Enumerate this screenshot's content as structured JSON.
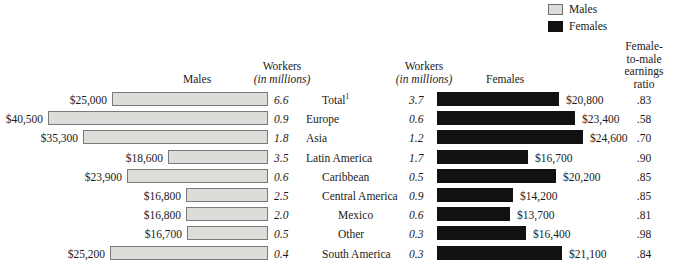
{
  "legend": {
    "items": [
      {
        "label": "Males",
        "swatch": "males-swatch",
        "color": "#dcdcd8"
      },
      {
        "label": "Females",
        "swatch": "females-swatch",
        "color": "#111111"
      }
    ]
  },
  "headers": {
    "males": "Males",
    "females": "Females",
    "workers_line1": "Workers",
    "workers_line2": "(in millions)",
    "ratio": "Female-\nto-male\nearnings\nratio",
    "ratio_lines": [
      "Female-",
      "to-male",
      "earnings",
      "ratio"
    ]
  },
  "chart_data": {
    "type": "bar",
    "title": "",
    "orientation": "horizontal",
    "layout": "bidirectional-population-pyramid",
    "xlabel": "",
    "ylabel": "",
    "grid": false,
    "legend_position": "top-right",
    "categories": [
      "Total¹",
      "Europe",
      "Asia",
      "Latin America",
      "Caribbean",
      "Central America",
      "Mexico",
      "Other",
      "South America"
    ],
    "category_indent_levels": [
      1,
      0,
      0,
      0,
      1,
      1,
      2,
      2,
      1
    ],
    "series": [
      {
        "name": "Males",
        "unit": "median annual earnings (USD)",
        "direction": "left",
        "color": "#dcdcd8",
        "values": [
          25000,
          40500,
          35300,
          18600,
          23900,
          16800,
          16800,
          16700,
          25200
        ],
        "labels": [
          "$25,000",
          "$40,500",
          "$35,300",
          "$18,600",
          "$23,900",
          "$16,800",
          "$16,800",
          "$16,700",
          "$25,200"
        ]
      },
      {
        "name": "Females",
        "unit": "median annual earnings (USD)",
        "direction": "right",
        "color": "#111111",
        "values": [
          20800,
          23400,
          24600,
          16700,
          20200,
          14200,
          13700,
          16400,
          21100
        ],
        "labels": [
          "$20,800",
          "$23,400",
          "$24,600",
          "$16,700",
          "$20,200",
          "$14,200",
          "$13,700",
          "$16,400",
          "$21,100"
        ]
      }
    ],
    "workers_males_millions": [
      6.6,
      0.9,
      1.8,
      3.5,
      0.6,
      2.5,
      2.0,
      0.5,
      0.4
    ],
    "workers_females_millions": [
      3.7,
      0.6,
      1.2,
      1.7,
      0.5,
      0.9,
      0.6,
      0.3,
      0.3
    ],
    "female_to_male_ratio": [
      0.83,
      0.58,
      0.7,
      0.9,
      0.85,
      0.85,
      0.81,
      0.98,
      0.84
    ]
  },
  "rows": [
    {
      "category": "Total",
      "superscript": "1",
      "indent": 1,
      "male_earnings": "$25,000",
      "male_workers": "6.6",
      "female_workers": "3.7",
      "female_earnings": "$20,800",
      "ratio": ".83",
      "male_bar_px": 156,
      "female_bar_px": 122
    },
    {
      "category": "Europe",
      "superscript": "",
      "indent": 0,
      "male_earnings": "$40,500",
      "male_workers": "0.9",
      "female_workers": "0.6",
      "female_earnings": "$23,400",
      "ratio": ".58",
      "male_bar_px": 220,
      "female_bar_px": 138
    },
    {
      "category": "Asia",
      "superscript": "",
      "indent": 0,
      "male_earnings": "$35,300",
      "male_workers": "1.8",
      "female_workers": "1.2",
      "female_earnings": "$24,600",
      "ratio": ".70",
      "male_bar_px": 185,
      "female_bar_px": 146
    },
    {
      "category": "Latin America",
      "superscript": "",
      "indent": 0,
      "male_earnings": "$18,600",
      "male_workers": "3.5",
      "female_workers": "1.7",
      "female_earnings": "$16,700",
      "ratio": ".90",
      "male_bar_px": 100,
      "female_bar_px": 91
    },
    {
      "category": "Caribbean",
      "superscript": "",
      "indent": 1,
      "male_earnings": "$23,900",
      "male_workers": "0.6",
      "female_workers": "0.5",
      "female_earnings": "$20,200",
      "ratio": ".85",
      "male_bar_px": 141,
      "female_bar_px": 119
    },
    {
      "category": "Central America",
      "superscript": "",
      "indent": 1,
      "male_earnings": "$16,800",
      "male_workers": "2.5",
      "female_workers": "0.9",
      "female_earnings": "$14,200",
      "ratio": ".85",
      "male_bar_px": 82,
      "female_bar_px": 76
    },
    {
      "category": "Mexico",
      "superscript": "",
      "indent": 2,
      "male_earnings": "$16,800",
      "male_workers": "2.0",
      "female_workers": "0.6",
      "female_earnings": "$13,700",
      "ratio": ".81",
      "male_bar_px": 82,
      "female_bar_px": 73
    },
    {
      "category": "Other",
      "superscript": "",
      "indent": 2,
      "male_earnings": "$16,700",
      "male_workers": "0.5",
      "female_workers": "0.3",
      "female_earnings": "$16,400",
      "ratio": ".98",
      "male_bar_px": 81,
      "female_bar_px": 89
    },
    {
      "category": "South America",
      "superscript": "",
      "indent": 1,
      "male_earnings": "$25,200",
      "male_workers": "0.4",
      "female_workers": "0.3",
      "female_earnings": "$21,100",
      "ratio": ".84",
      "male_bar_px": 158,
      "female_bar_px": 125
    }
  ],
  "geometry": {
    "male_bar_right_edge_px": 268,
    "female_bar_left_edge_px": 437,
    "row_height_px": 19.2,
    "bar_height_px": 14,
    "label_left_px": 306,
    "indent_step_px": 16
  }
}
